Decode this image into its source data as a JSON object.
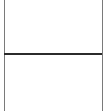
{
  "panes": [
    {
      "name": "top-pane",
      "content": ""
    },
    {
      "name": "bottom-pane",
      "content": ""
    }
  ],
  "colors": {
    "background": "#ffffff",
    "border": "#7a7a7a",
    "divider": "#2b2b2b"
  }
}
